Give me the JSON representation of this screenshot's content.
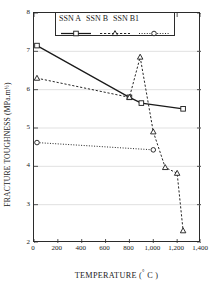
{
  "chart_data": {
    "type": "line",
    "title": "",
    "xlabel": "TEMPERATURE ( ° C )",
    "ylabel": "FRACTURE TOUGHNESS (MPa.m½)",
    "xlim": [
      0,
      1400
    ],
    "ylim": [
      2,
      8
    ],
    "grid": true,
    "grid_axis": "y",
    "legend_position": "top-center",
    "xticks": [
      "0",
      "200",
      "400",
      "600",
      "800",
      "1,000",
      "1,200",
      "1,400"
    ],
    "xtick_values": [
      0,
      200,
      400,
      600,
      800,
      1000,
      1200,
      1400
    ],
    "yticks": [
      "2",
      "3",
      "4",
      "5",
      "6",
      "7",
      "8"
    ],
    "ytick_values": [
      2,
      3,
      4,
      5,
      6,
      7,
      8
    ],
    "series": [
      {
        "name": "SSN A",
        "marker": "open-square",
        "linestyle": "solid",
        "color": "#1a1a1a",
        "x": [
          25,
          800,
          900,
          1250
        ],
        "values": [
          7.15,
          5.8,
          5.65,
          5.5
        ]
      },
      {
        "name": "SSN B",
        "marker": "open-triangle",
        "linestyle": "dashed",
        "color": "#1a1a1a",
        "x": [
          25,
          800,
          890,
          1000,
          1100,
          1200,
          1250
        ],
        "values": [
          6.3,
          5.8,
          6.85,
          4.9,
          3.97,
          3.82,
          2.32
        ]
      },
      {
        "name": "SSN B1",
        "marker": "open-circle",
        "linestyle": "dotted",
        "color": "#1a1a1a",
        "x": [
          25,
          1000
        ],
        "values": [
          4.62,
          4.43
        ]
      }
    ]
  },
  "axis_titles": {
    "x_main": "TEMPERATURE (",
    "x_degree": "°",
    "x_tail": " C )",
    "y_main": "FRACTURE TOUGHNESS (MPa.m",
    "y_sup": "½",
    "y_tail": " )"
  },
  "legend": {
    "entries": [
      {
        "label": "SSN A",
        "marker": "open-square",
        "linestyle": "solid"
      },
      {
        "label": "SSN B",
        "marker": "open-triangle",
        "linestyle": "dashed"
      },
      {
        "label": "SSN B1",
        "marker": "open-circle",
        "linestyle": "dotted"
      }
    ]
  },
  "colors": {
    "ink": "#1a1a1a",
    "frame": "#2b2b2b",
    "grid": "#d9d9d9",
    "background": "#ffffff"
  }
}
